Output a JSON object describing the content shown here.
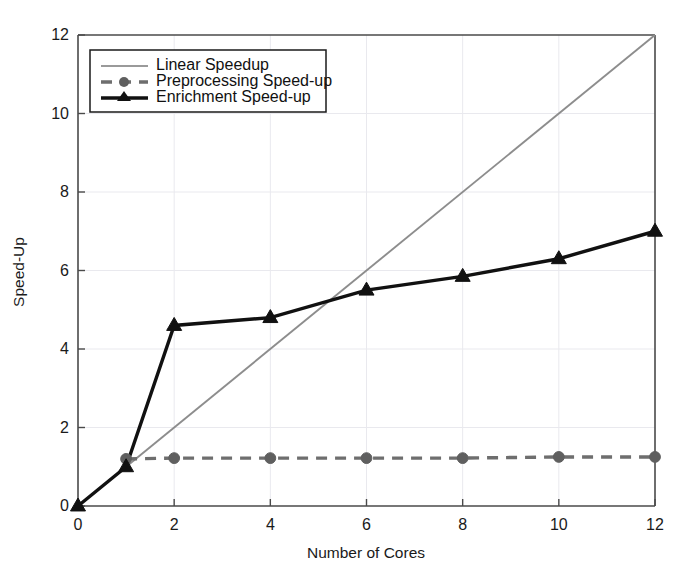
{
  "chart_data": {
    "type": "line",
    "title": "",
    "xlabel": "Number of Cores",
    "ylabel": "Speed-Up",
    "xlim": [
      0,
      12
    ],
    "ylim": [
      0,
      12
    ],
    "xticks": [
      0,
      2,
      4,
      6,
      8,
      10,
      12
    ],
    "yticks": [
      0,
      2,
      4,
      6,
      8,
      10,
      12
    ],
    "xtick_labels": [
      "0",
      "2",
      "4",
      "6",
      "8",
      "10",
      "12"
    ],
    "ytick_labels": [
      "0",
      "2",
      "4",
      "6",
      "8",
      "10",
      "12"
    ],
    "grid": true,
    "legend_position": "upper left",
    "series": [
      {
        "name": "Linear Speedup",
        "style": "solid",
        "color": "#8d8d8d",
        "marker": "none",
        "x": [
          0,
          12
        ],
        "values": [
          0,
          12
        ]
      },
      {
        "name": "Preprocessing Speed-up",
        "style": "dashed",
        "color": "#6e6e6e",
        "marker": "circle",
        "x": [
          1,
          2,
          4,
          6,
          8,
          10,
          12
        ],
        "values": [
          1.2,
          1.22,
          1.22,
          1.22,
          1.22,
          1.25,
          1.25
        ]
      },
      {
        "name": "Enrichment Speed-up",
        "style": "solid",
        "color": "#111111",
        "marker": "triangle",
        "x": [
          0,
          1,
          2,
          4,
          6,
          8,
          10,
          12
        ],
        "values": [
          0,
          1.0,
          4.6,
          4.8,
          5.5,
          5.85,
          6.3,
          7.0
        ]
      }
    ]
  },
  "axes": {
    "x_title": "Number of Cores",
    "y_title": "Speed-Up"
  },
  "legend": {
    "entries": [
      {
        "label": "Linear Speedup"
      },
      {
        "label": "Preprocessing Speed-up"
      },
      {
        "label": "Enrichment Speed-up"
      }
    ]
  }
}
